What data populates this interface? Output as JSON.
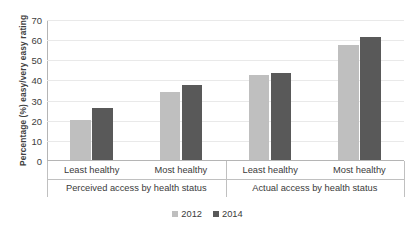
{
  "title_strip": "",
  "chart_data": {
    "type": "bar",
    "title": "",
    "subtitle": "",
    "xlabel": "",
    "ylabel": "Percentage (%) easy/very easy rating",
    "ylim": [
      0,
      70
    ],
    "ytick_step": 10,
    "yticks": [
      70,
      60,
      50,
      40,
      30,
      20,
      10,
      0
    ],
    "grid": true,
    "legend_position": "bottom",
    "legend": [
      "2012",
      "2014"
    ],
    "colors": {
      "2012": "#bfbfbf",
      "2014": "#595959",
      "gridline": "#e9e9e9",
      "axis": "#b5b5b5",
      "text": "#3a3a3a"
    },
    "groups": [
      {
        "label": "Perceived access by health status",
        "categories": [
          "Least healthy",
          "Most healthy"
        ]
      },
      {
        "label": "Actual access by health status",
        "categories": [
          "Least healthy",
          "Most healthy"
        ]
      }
    ],
    "categories": [
      "Least healthy",
      "Most healthy",
      "Least healthy",
      "Most healthy"
    ],
    "series": [
      {
        "name": "2012",
        "values": [
          20,
          34,
          42,
          57
        ]
      },
      {
        "name": "2014",
        "values": [
          26,
          37,
          43,
          61
        ]
      }
    ]
  }
}
